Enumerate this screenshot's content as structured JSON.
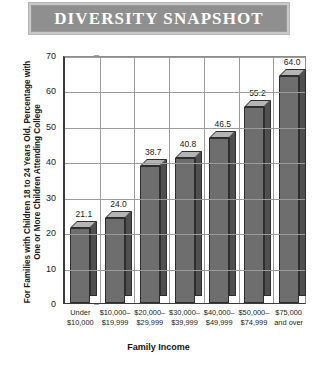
{
  "banner": {
    "title": "DIVERSITY SNAPSHOT"
  },
  "chart_data": {
    "type": "bar",
    "title": "DIVERSITY SNAPSHOT",
    "xlabel": "Family Income",
    "ylabel": "For Families with Children 18 to 24 Years Old, Percentage with One or More Children Attending College",
    "categories": [
      "Under $10,000",
      "$10,000–$19,999",
      "$20,000–$29,999",
      "$30,000–$39,999",
      "$40,000–$49,999",
      "$50,000–$74,999",
      "$75,000 and over"
    ],
    "category_lines": [
      [
        "Under",
        "$10,000"
      ],
      [
        "$10,000–",
        "$19,999"
      ],
      [
        "$20,000–",
        "$29,999"
      ],
      [
        "$30,000–",
        "$39,999"
      ],
      [
        "$40,000–",
        "$49,999"
      ],
      [
        "$50,000–",
        "$74,999"
      ],
      [
        "$75,000",
        "and over"
      ]
    ],
    "values": [
      21.1,
      24.0,
      38.7,
      40.8,
      46.5,
      55.2,
      64.0
    ],
    "value_labels": [
      "21.1",
      "24.0",
      "38.7",
      "40.8",
      "46.5",
      "55.2",
      "64.0"
    ],
    "ylim": [
      0,
      70
    ],
    "yticks": [
      0,
      10,
      20,
      30,
      40,
      50,
      60,
      70
    ],
    "ytick_labels": [
      "0",
      "10",
      "20",
      "30",
      "40",
      "50",
      "60",
      "70"
    ],
    "grid": true,
    "legend": null,
    "colors": {
      "bar_front": "#6e6e6e",
      "bar_top": "#b4b4b4",
      "bar_side": "#4f4f4f",
      "banner_fill": "#8f8f8f",
      "banner_border": "#c8c8c8",
      "grid": "#9b9b9b",
      "axis": "#3a3a3a",
      "text": "#1a1a1a"
    }
  }
}
